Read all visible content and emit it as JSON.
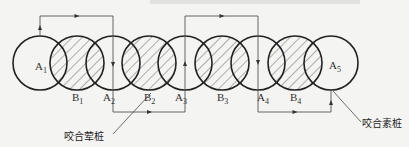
{
  "diagram": {
    "title_fragment_visible": "",
    "primary_piles": [
      {
        "id": "A1",
        "base": "A",
        "sub": "1",
        "cx": 40
      },
      {
        "id": "A2",
        "base": "A",
        "sub": "2",
        "cx": 113
      },
      {
        "id": "A3",
        "base": "A",
        "sub": "3",
        "cx": 185
      },
      {
        "id": "A4",
        "base": "A",
        "sub": "4",
        "cx": 258
      },
      {
        "id": "A5",
        "base": "A",
        "sub": "5",
        "cx": 331
      }
    ],
    "secondary_piles": [
      {
        "id": "B1",
        "base": "B",
        "sub": "1",
        "cx": 77
      },
      {
        "id": "B2",
        "base": "B",
        "sub": "2",
        "cx": 149
      },
      {
        "id": "B3",
        "base": "B",
        "sub": "3",
        "cx": 222
      },
      {
        "id": "B4",
        "base": "B",
        "sub": "4",
        "cx": 295
      }
    ],
    "circle_cy": 63,
    "circle_r": 27,
    "path_top_y": 16,
    "path_bottom_y": 112,
    "labels": {
      "reinforced_pile": "咬合荤桩",
      "plain_pile": "咬合素桩"
    },
    "colors": {
      "line": "#222222",
      "hatch": "#444444",
      "background": "#f4f4f2"
    }
  }
}
